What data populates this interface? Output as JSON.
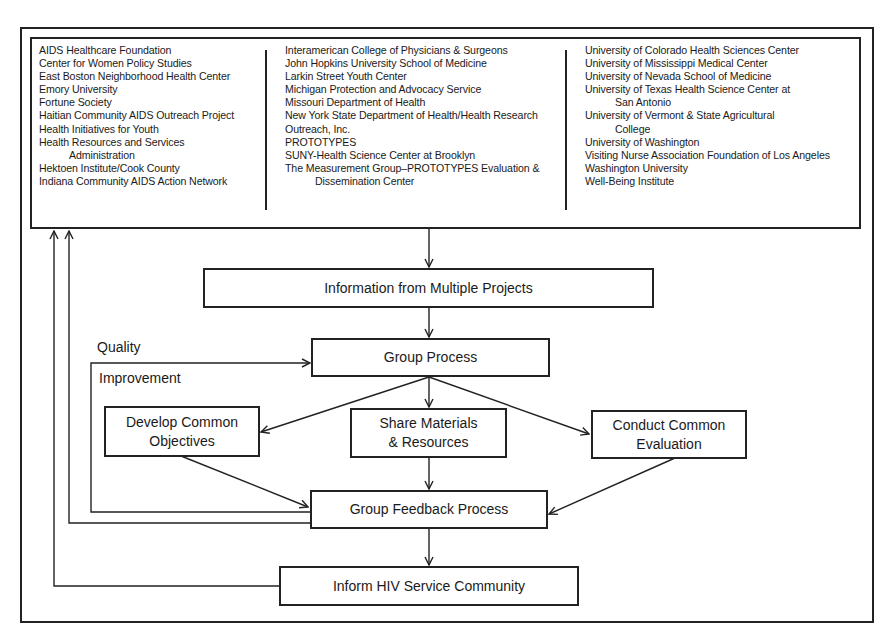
{
  "participants": {
    "column_1": [
      {
        "text": "AIDS Healthcare Foundation",
        "indent": false
      },
      {
        "text": "Center for Women Policy Studies",
        "indent": false
      },
      {
        "text": "East Boston Neighborhood Health Center",
        "indent": false
      },
      {
        "text": "Emory University",
        "indent": false
      },
      {
        "text": "Fortune Society",
        "indent": false
      },
      {
        "text": "Haitian Community AIDS Outreach Project",
        "indent": false
      },
      {
        "text": "Health Initiatives for Youth",
        "indent": false
      },
      {
        "text": "Health Resources and Services",
        "indent": false
      },
      {
        "text": "Administration",
        "indent": true
      },
      {
        "text": "Hektoen Institute/Cook County",
        "indent": false
      },
      {
        "text": "Indiana Community AIDS Action Network",
        "indent": false
      }
    ],
    "column_2": [
      {
        "text": "Interamerican College of Physicians & Surgeons",
        "indent": false
      },
      {
        "text": "John Hopkins University School of Medicine",
        "indent": false
      },
      {
        "text": "Larkin Street Youth Center",
        "indent": false
      },
      {
        "text": "Michigan Protection and Advocacy Service",
        "indent": false
      },
      {
        "text": "Missouri Department of Health",
        "indent": false
      },
      {
        "text": "New York State Department of Health/Health Research",
        "indent": false
      },
      {
        "text": "Outreach, Inc.",
        "indent": false
      },
      {
        "text": "PROTOTYPES",
        "indent": false
      },
      {
        "text": "SUNY-Health Science Center at Brooklyn",
        "indent": false
      },
      {
        "text": "The Measurement Group–PROTOTYPES Evaluation &",
        "indent": false
      },
      {
        "text": "Dissemination Center",
        "indent": true
      }
    ],
    "column_3": [
      {
        "text": "University of Colorado Health Sciences Center",
        "indent": false
      },
      {
        "text": "University of Mississippi Medical Center",
        "indent": false
      },
      {
        "text": "University of Nevada School of Medicine",
        "indent": false
      },
      {
        "text": "University of Texas Health Science Center at",
        "indent": false
      },
      {
        "text": "San Antonio",
        "indent": true
      },
      {
        "text": "University of Vermont & State Agricultural",
        "indent": false
      },
      {
        "text": "College",
        "indent": true
      },
      {
        "text": "University of Washington",
        "indent": false
      },
      {
        "text": "Visiting Nurse Association Foundation of Los Angeles",
        "indent": false
      },
      {
        "text": "Washington University",
        "indent": false
      },
      {
        "text": "Well-Being Institute",
        "indent": false
      }
    ]
  },
  "nodes": {
    "info": "Information from Multiple Projects",
    "group_process": "Group Process",
    "develop_line1": "Develop Common",
    "develop_line2": "Objectives",
    "share_line1": "Share Materials",
    "share_line2": "& Resources",
    "conduct_line1": "Conduct Common",
    "conduct_line2": "Evaluation",
    "feedback": "Group Feedback Process",
    "inform": "Inform HIV Service Community"
  },
  "labels": {
    "quality": "Quality",
    "improvement": "Improvement"
  },
  "colors": {
    "stroke": "#222222",
    "background": "#ffffff"
  }
}
